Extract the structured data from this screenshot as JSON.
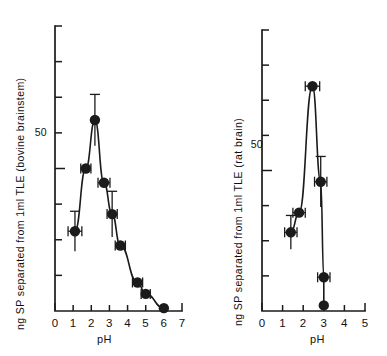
{
  "figure": {
    "panels": [
      {
        "id": "left",
        "ylabel": "ng SP separated  from 1ml  TLE (bovine brainstem)",
        "xlabel": "pH",
        "ytick_label_50": "50"
      },
      {
        "id": "right",
        "ylabel": "ng SP separated from 1ml TLE (rat brain)",
        "xlabel": "pH",
        "ytick_label_50": "50"
      }
    ]
  },
  "chart_data": [
    {
      "type": "line",
      "panel": "left",
      "title": "",
      "xlabel": "pH",
      "ylabel": "ng SP separated  from 1ml  TLE (bovine brainstem)",
      "xlim": [
        0,
        7
      ],
      "ylim": [
        0,
        100
      ],
      "xticks": [
        0,
        1,
        2,
        3,
        4,
        5,
        6,
        7
      ],
      "xtick_labels": [
        "0",
        "1",
        "2",
        "3",
        "4",
        "5",
        "6",
        "7"
      ],
      "yticks": [
        0,
        12.5,
        25,
        37.5,
        50,
        62.5,
        75,
        87.5,
        100
      ],
      "ytick_labels": [
        "",
        "",
        "",
        "",
        "50",
        "",
        "",
        "",
        ""
      ],
      "grid": false,
      "legend": "none",
      "marker": "filled-circle",
      "errorbars": true,
      "x": [
        1.1,
        1.7,
        2.2,
        2.7,
        3.15,
        3.6,
        4.55,
        5.0,
        6.0
      ],
      "values": [
        28,
        50,
        67,
        45,
        34,
        23,
        10,
        6,
        1
      ],
      "xerr": [
        0.38,
        0.28,
        0.0,
        0.33,
        0.28,
        0.28,
        0.28,
        0.25,
        0.0
      ],
      "yerr": [
        7,
        0,
        9,
        0,
        8,
        0,
        0,
        0,
        0
      ]
    },
    {
      "type": "line",
      "panel": "right",
      "title": "",
      "xlabel": "pH",
      "ylabel": "ng SP separated from 1ml TLE (rat brain)",
      "xlim": [
        0,
        5
      ],
      "ylim": [
        0,
        100
      ],
      "xticks": [
        0,
        1,
        2,
        3,
        4,
        5
      ],
      "xtick_labels": [
        "0",
        "1",
        "2",
        "3",
        "4",
        "5"
      ],
      "yticks": [
        0,
        12.5,
        25,
        37.5,
        50,
        62.5,
        75,
        87.5,
        100
      ],
      "ytick_labels": [
        "",
        "",
        "",
        "",
        "50",
        "",
        "",
        "",
        ""
      ],
      "grid": false,
      "legend": "none",
      "marker": "filled-circle",
      "errorbars": true,
      "x": [
        1.4,
        1.8,
        2.45,
        2.85,
        3.0,
        3.0
      ],
      "values": [
        28,
        35,
        80,
        46,
        12,
        2
      ],
      "xerr": [
        0.3,
        0.3,
        0.35,
        0.3,
        0.3,
        0.0
      ],
      "yerr": [
        6,
        0,
        0,
        9,
        0,
        0
      ]
    }
  ]
}
